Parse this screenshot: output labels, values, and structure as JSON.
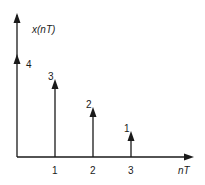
{
  "chart_data": {
    "type": "stem",
    "title": "",
    "xlabel": "nT",
    "ylabel": "x(nT)",
    "x": [
      0,
      1,
      2,
      3
    ],
    "values": [
      4,
      3,
      2,
      1
    ],
    "value_labels": [
      "4",
      "3",
      "2",
      "1"
    ],
    "x_tick_labels": [
      "1",
      "2",
      "3"
    ],
    "grid": false,
    "legend": null,
    "marker": "arrow"
  },
  "colors": {
    "ink": "#1a1a1a",
    "background": "#ffffff"
  }
}
